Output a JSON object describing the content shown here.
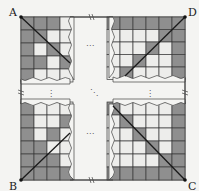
{
  "labels": {
    "A": "A",
    "B": "B",
    "C": "C",
    "D": "D"
  },
  "ellipsis": {
    "horizontal": "⋯",
    "vertical": "⋮",
    "diagonal": "⋱"
  },
  "colors": {
    "background": "#f4f4f2",
    "dark_cell": "#8f8f8f",
    "light_cell": "#ededeb",
    "grid_line": "#3a3a3a",
    "diagonal": "#1a1a1a",
    "border": "#333333"
  },
  "break_mark": "≈",
  "grid_pattern_top_left": [
    [
      1,
      1,
      1,
      0
    ],
    [
      1,
      1,
      0,
      0
    ],
    [
      1,
      0,
      1,
      0
    ],
    [
      1,
      1,
      0,
      1
    ],
    [
      1,
      0,
      0,
      0
    ]
  ],
  "grid_pattern_top_right": [
    [
      1,
      1,
      1,
      1,
      1,
      1
    ],
    [
      0,
      0,
      0,
      0,
      1,
      1
    ],
    [
      0,
      0,
      0,
      1,
      0,
      1
    ],
    [
      0,
      0,
      1,
      0,
      0,
      1
    ],
    [
      0,
      1,
      0,
      0,
      0,
      1
    ]
  ],
  "grid_pattern_bottom_left": [
    [
      1,
      0,
      0,
      0
    ],
    [
      1,
      0,
      0,
      1
    ],
    [
      1,
      0,
      1,
      0
    ],
    [
      1,
      1,
      0,
      0
    ],
    [
      1,
      1,
      1,
      0
    ],
    [
      1,
      1,
      1,
      1
    ]
  ],
  "grid_pattern_bottom_right": [
    [
      1,
      0,
      0,
      0,
      0,
      1
    ],
    [
      0,
      1,
      0,
      0,
      0,
      1
    ],
    [
      0,
      0,
      1,
      0,
      0,
      1
    ],
    [
      0,
      0,
      0,
      1,
      0,
      1
    ],
    [
      0,
      0,
      0,
      0,
      1,
      1
    ],
    [
      1,
      1,
      1,
      1,
      1,
      1
    ]
  ]
}
